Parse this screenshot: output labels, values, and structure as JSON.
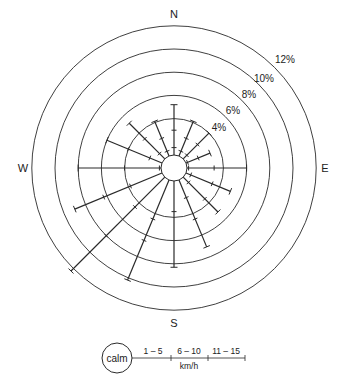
{
  "chart_data": {
    "type": "wind-rose",
    "title": "",
    "compass_labels": {
      "N": "N",
      "E": "E",
      "S": "S",
      "W": "W"
    },
    "ring_labels": [
      "4%",
      "6%",
      "8%",
      "10%",
      "12%"
    ],
    "ring_values": [
      4,
      6,
      8,
      10,
      12
    ],
    "directions": [
      "N",
      "NNE",
      "NE",
      "ENE",
      "E",
      "ESE",
      "SE",
      "SSE",
      "S",
      "SSW",
      "SW",
      "WSW",
      "W",
      "WNW",
      "NW",
      "NNW"
    ],
    "speed_classes": [
      "1 – 5",
      "6 – 10",
      "11 – 15"
    ],
    "speed_unit": "km/h",
    "calm_label": "calm",
    "series": [
      {
        "direction": "N",
        "total_pct": 5.2,
        "segments_pct": [
          1.5,
          1.5,
          2.2
        ]
      },
      {
        "direction": "NNE",
        "total_pct": 4.1,
        "segments_pct": [
          1.3,
          1.2,
          1.6
        ]
      },
      {
        "direction": "NE",
        "total_pct": 4.0,
        "segments_pct": [
          1.3,
          1.3,
          1.4
        ]
      },
      {
        "direction": "ENE",
        "total_pct": 3.1,
        "segments_pct": [
          1.0,
          1.0,
          1.1
        ]
      },
      {
        "direction": "E",
        "total_pct": 6.0,
        "segments_pct": [
          1.0,
          2.2,
          2.8
        ]
      },
      {
        "direction": "ESE",
        "total_pct": 5.0,
        "segments_pct": [
          1.3,
          2.0,
          1.7
        ]
      },
      {
        "direction": "SE",
        "total_pct": 5.1,
        "segments_pct": [
          1.5,
          2.0,
          1.6
        ]
      },
      {
        "direction": "SSE",
        "total_pct": 7.1,
        "segments_pct": [
          2.5,
          2.0,
          2.6
        ]
      },
      {
        "direction": "S",
        "total_pct": 8.3,
        "segments_pct": [
          3.5,
          4.8,
          0.0
        ]
      },
      {
        "direction": "SSW",
        "total_pct": 10.2,
        "segments_pct": [
          4.5,
          2.0,
          3.7
        ]
      },
      {
        "direction": "SW",
        "total_pct": 12.3,
        "segments_pct": [
          4.5,
          3.5,
          4.3
        ]
      },
      {
        "direction": "WSW",
        "total_pct": 9.0,
        "segments_pct": [
          3.8,
          2.5,
          2.7
        ]
      },
      {
        "direction": "W",
        "total_pct": 8.0,
        "segments_pct": [
          1.0,
          3.0,
          4.0
        ]
      },
      {
        "direction": "WNW",
        "total_pct": 6.0,
        "segments_pct": [
          2.0,
          2.0,
          2.0
        ]
      },
      {
        "direction": "NW",
        "total_pct": 5.2,
        "segments_pct": [
          1.5,
          1.8,
          1.9
        ]
      },
      {
        "direction": "NNW",
        "total_pct": 4.1,
        "segments_pct": [
          1.3,
          1.2,
          1.6
        ]
      }
    ],
    "colors": {
      "line": "#2a2a2a",
      "background": "#ffffff"
    }
  }
}
